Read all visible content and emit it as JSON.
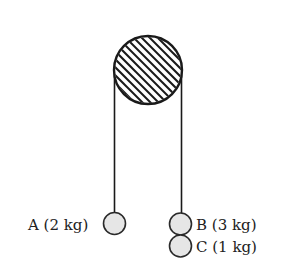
{
  "diagram": {
    "type": "atwood-machine",
    "colors": {
      "line": "#1a1a1a",
      "mass_fill": "#e6e6e6",
      "background": "#ffffff"
    },
    "pulley": {
      "cx": 148,
      "cy": 70,
      "r": 34,
      "pattern": "diagonal-hatch"
    },
    "masses": [
      {
        "id": "A",
        "label": "A (2 kg)",
        "mass_kg": 2,
        "side": "left",
        "cx": 114,
        "cy": 223,
        "r": 11
      },
      {
        "id": "B",
        "label": "B (3 kg)",
        "mass_kg": 3,
        "side": "right",
        "cx": 180,
        "cy": 224,
        "r": 11
      },
      {
        "id": "C",
        "label": "C (1 kg)",
        "mass_kg": 1,
        "side": "right",
        "cx": 180,
        "cy": 246,
        "r": 11
      }
    ]
  },
  "labels": {
    "mass_a": "A (2 kg)",
    "mass_b": "B (3 kg)",
    "mass_c": "C (1 kg)"
  }
}
